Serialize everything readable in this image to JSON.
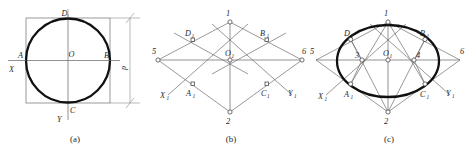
{
  "figure": {
    "panels": [
      {
        "id": "a",
        "caption": "(a)",
        "description": "True-shape circle of diameter d inscribed in its circumscribing square with X and Y axes",
        "labels": {
          "top_point": "D",
          "bottom_point": "C",
          "left_point": "A",
          "right_point": "B",
          "centre": "O",
          "axis_x": "X",
          "axis_y": "Y",
          "dimension": "d"
        }
      },
      {
        "id": "b",
        "caption": "(b)",
        "description": "Isometric rhombus with midpoints of the sides and the four construction centres",
        "labels": {
          "centre": "O",
          "centre_sub": "1",
          "top_vertex": "1",
          "bottom_vertex": "2",
          "left_vertex": "5",
          "right_vertex": "6",
          "mid_upper_left": "D",
          "mid_upper_left_sub": "1",
          "mid_upper_right": "B",
          "mid_upper_right_sub": "1",
          "mid_lower_left": "A",
          "mid_lower_left_sub": "1",
          "mid_lower_right": "C",
          "mid_lower_right_sub": "1",
          "axis_x": "X",
          "axis_x_sub": "1",
          "axis_y": "Y",
          "axis_y_sub": "1"
        }
      },
      {
        "id": "c",
        "caption": "(c)",
        "description": "Completed isometric ellipse drawn from the four centres 1, 2, 3 and 4",
        "labels": {
          "centre": "O",
          "centre_sub": "1",
          "top_vertex": "1",
          "bottom_vertex": "2",
          "left_vertex": "5",
          "right_vertex": "6",
          "inner_left_centre": "3",
          "inner_right_centre": "4",
          "mid_upper_left": "D",
          "mid_upper_left_sub": "1",
          "mid_upper_right": "B",
          "mid_upper_right_sub": "1",
          "mid_lower_left": "A",
          "mid_lower_left_sub": "1",
          "mid_lower_right": "C",
          "mid_lower_right_sub": "1",
          "axis_x": "X",
          "axis_x_sub": "1",
          "axis_y": "Y",
          "axis_y_sub": "1"
        }
      }
    ]
  },
  "style": {
    "outline_color": "#111111",
    "construction_color": "#6d6d6d",
    "background": "#ffffff"
  }
}
